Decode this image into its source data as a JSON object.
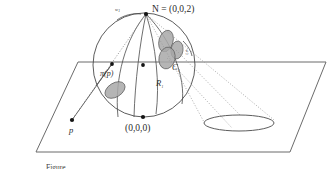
{
  "figure": {
    "caption": "Figure",
    "background_color": "#ffffff",
    "stroke_color": "#4a4a4a",
    "dot_color": "#1a1a1a",
    "blob_fill": "#a8a8a8",
    "blob_stroke": "#5a5a5a",
    "dotted_color": "#9a9a9a"
  },
  "labels": {
    "north_pole": "N = (0,0,2)",
    "origin": "(0,0,0)",
    "point_p": "p",
    "projection_of_p": "π(p)",
    "region_r": "R",
    "region_r_sub": "1",
    "set_c": "C",
    "set_c_sub": "1",
    "w_left": "w",
    "w_left_sub": "1",
    "w_right": "w",
    "w_right_sub": "2"
  },
  "geometry": {
    "sphere_center_x": 144,
    "sphere_center_y": 65,
    "sphere_radius_x": 51,
    "sphere_radius_y": 52,
    "north_pole_point": [
      146,
      14
    ],
    "origin_point": [
      143,
      117
    ],
    "p_point": [
      72,
      120
    ],
    "projection_point": [
      112,
      64
    ],
    "center_dot": [
      143,
      65
    ],
    "ellipse_on_plane": {
      "cx": 239,
      "cy": 123,
      "rx": 35,
      "ry": 8
    }
  },
  "blobs": [
    {
      "name": "blob-left",
      "cx": 115,
      "cy": 90,
      "rx": 11,
      "ry": 7,
      "rotate": -32
    },
    {
      "name": "blob-top-right",
      "cx": 166,
      "cy": 41,
      "rx": 7,
      "ry": 11,
      "rotate": 16
    },
    {
      "name": "blob-mid-right",
      "cx": 176,
      "cy": 50,
      "rx": 6,
      "ry": 9,
      "rotate": 8
    },
    {
      "name": "blob-lower-right",
      "cx": 167,
      "cy": 58,
      "rx": 8,
      "ry": 11,
      "rotate": 12
    }
  ]
}
